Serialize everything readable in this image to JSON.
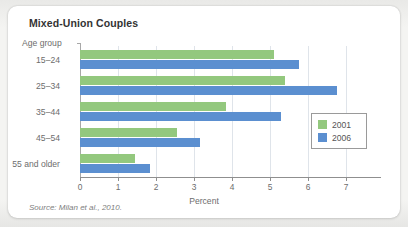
{
  "card": {
    "title": "Mixed-Union Couples",
    "source": "Source: Milan et al., 2010."
  },
  "chart_data": {
    "type": "bar",
    "orientation": "horizontal",
    "title": "Mixed-Union Couples",
    "xlabel": "Percent",
    "ylabel": "Age group",
    "categories": [
      "15–24",
      "25–34",
      "35–44",
      "45–54",
      "55 and older"
    ],
    "series": [
      {
        "name": "2001",
        "color": "#93c87e",
        "values": [
          5.1,
          5.4,
          3.85,
          2.55,
          1.45
        ]
      },
      {
        "name": "2006",
        "color": "#5b8fd0",
        "values": [
          5.75,
          6.75,
          5.3,
          3.15,
          1.85
        ]
      }
    ],
    "xlim": [
      0,
      7.9
    ],
    "xticks": [
      0,
      1,
      2,
      3,
      4,
      5,
      6,
      7
    ],
    "xtick_labels": [
      "0",
      "1",
      "2",
      "3",
      "4",
      "5",
      "6",
      "7"
    ],
    "grid": "vertical",
    "legend_position": "center-right"
  }
}
